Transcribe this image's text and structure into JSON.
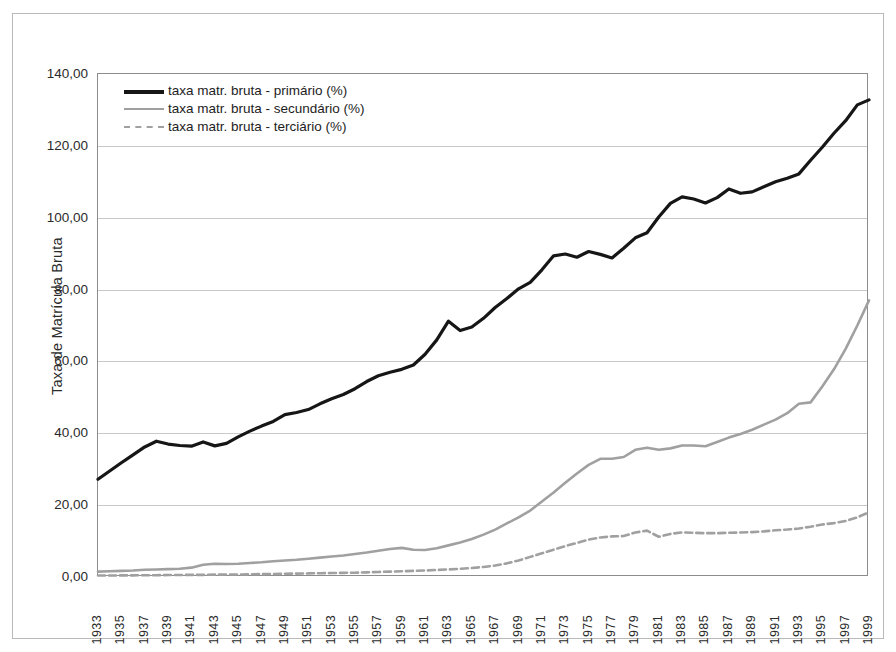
{
  "chart_data": {
    "type": "line",
    "title": "",
    "xlabel": "",
    "ylabel": "Taxa de Matrícula Bruta",
    "ylim": [
      0,
      140
    ],
    "ytick_labels": [
      "0,00",
      "20,00",
      "40,00",
      "60,00",
      "80,00",
      "100,00",
      "120,00",
      "140,00"
    ],
    "ytick_values": [
      0,
      20,
      40,
      60,
      80,
      100,
      120,
      140
    ],
    "grid": true,
    "legend_position": "top-left",
    "x": [
      1933,
      1934,
      1935,
      1936,
      1937,
      1938,
      1939,
      1940,
      1941,
      1942,
      1943,
      1944,
      1945,
      1946,
      1947,
      1948,
      1949,
      1950,
      1951,
      1952,
      1953,
      1954,
      1955,
      1956,
      1957,
      1958,
      1959,
      1960,
      1961,
      1962,
      1963,
      1964,
      1965,
      1966,
      1967,
      1968,
      1969,
      1970,
      1971,
      1972,
      1973,
      1974,
      1975,
      1976,
      1977,
      1978,
      1979,
      1980,
      1981,
      1982,
      1983,
      1984,
      1985,
      1986,
      1987,
      1988,
      1989,
      1990,
      1991,
      1992,
      1993,
      1994,
      1995,
      1996,
      1997,
      1998,
      1999
    ],
    "xtick_labels": [
      "1933",
      "1935",
      "1937",
      "1939",
      "1941",
      "1943",
      "1945",
      "1947",
      "1949",
      "1951",
      "1953",
      "1955",
      "1957",
      "1959",
      "1961",
      "1963",
      "1965",
      "1967",
      "1969",
      "1971",
      "1973",
      "1975",
      "1977",
      "1979",
      "1981",
      "1983",
      "1985",
      "1987",
      "1989",
      "1991",
      "1993",
      "1995",
      "1997",
      "1999"
    ],
    "xlim": [
      1933,
      1999
    ],
    "series": [
      {
        "name": "taxa matr. bruta - primário (%)",
        "color": "#161616",
        "style": "solid",
        "width": 3.2,
        "values": [
          27.2,
          29.5,
          31.8,
          34.0,
          36.2,
          37.8,
          37.0,
          36.6,
          36.4,
          37.6,
          36.5,
          37.2,
          39.0,
          40.6,
          42.0,
          43.3,
          45.2,
          45.8,
          46.6,
          48.2,
          49.6,
          50.8,
          52.4,
          54.4,
          56.0,
          57.0,
          57.8,
          59.0,
          62.0,
          66.0,
          71.2,
          68.6,
          69.6,
          72.0,
          75.0,
          77.5,
          80.2,
          82.0,
          85.5,
          89.4,
          89.9,
          89.0,
          90.6,
          89.8,
          88.8,
          91.5,
          94.4,
          95.8,
          100.2,
          104.0,
          105.8,
          105.2,
          104.1,
          105.6,
          108.0,
          106.8,
          107.2,
          108.6,
          110.0,
          111.0,
          112.2,
          116.0,
          119.6,
          123.5,
          127.0,
          131.4,
          132.8
        ]
      },
      {
        "name": "taxa matr. bruta - secundário (%)",
        "color": "#a0a0a0",
        "style": "solid",
        "width": 2.6,
        "values": [
          1.5,
          1.6,
          1.7,
          1.8,
          2.0,
          2.1,
          2.2,
          2.3,
          2.6,
          3.4,
          3.7,
          3.6,
          3.7,
          3.9,
          4.1,
          4.4,
          4.6,
          4.8,
          5.1,
          5.4,
          5.7,
          6.0,
          6.4,
          6.8,
          7.3,
          7.8,
          8.1,
          7.6,
          7.5,
          8.0,
          8.8,
          9.6,
          10.6,
          11.8,
          13.2,
          14.9,
          16.6,
          18.5,
          21.0,
          23.5,
          26.2,
          28.8,
          31.2,
          32.9,
          32.9,
          33.4,
          35.4,
          36.0,
          35.4,
          35.8,
          36.6,
          36.6,
          36.4,
          37.6,
          38.8,
          39.8,
          41.0,
          42.4,
          43.8,
          45.6,
          48.2,
          48.6,
          53.0,
          57.8,
          63.5,
          70.0,
          77.0
        ]
      },
      {
        "name": "taxa matr. bruta - terciário (%)",
        "color": "#a0a0a0",
        "style": "dashed",
        "width": 2.6,
        "values": [
          0.4,
          0.4,
          0.45,
          0.45,
          0.5,
          0.5,
          0.55,
          0.55,
          0.6,
          0.6,
          0.65,
          0.7,
          0.7,
          0.75,
          0.8,
          0.85,
          0.9,
          0.95,
          1.0,
          1.05,
          1.1,
          1.15,
          1.2,
          1.3,
          1.4,
          1.5,
          1.6,
          1.7,
          1.8,
          1.95,
          2.1,
          2.3,
          2.5,
          2.8,
          3.2,
          3.8,
          4.6,
          5.6,
          6.6,
          7.6,
          8.6,
          9.5,
          10.4,
          11.0,
          11.3,
          11.4,
          12.4,
          12.9,
          11.2,
          12.0,
          12.4,
          12.3,
          12.2,
          12.2,
          12.3,
          12.4,
          12.5,
          12.7,
          13.0,
          13.2,
          13.5,
          14.0,
          14.6,
          15.0,
          15.6,
          16.6,
          18.0
        ]
      }
    ]
  },
  "legend": {
    "items": [
      {
        "label": "taxa matr. bruta - primário (%)"
      },
      {
        "label": "taxa matr. bruta - secundário (%)"
      },
      {
        "label": "taxa matr. bruta - terciário (%)"
      }
    ]
  }
}
